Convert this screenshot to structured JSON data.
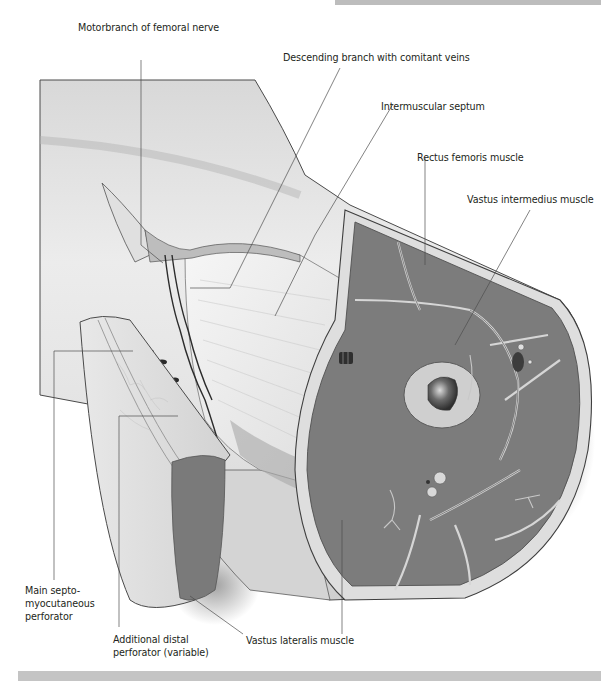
{
  "figure": {
    "style": "greyscale medical illustration",
    "colors": {
      "background": "#ffffff",
      "frame_bar": "#c4c4c4",
      "skin_light": "#e6e6e6",
      "skin_shade": "#bfbfbf",
      "muscle": "#7a7a7a",
      "fascia": "#d9d9d9",
      "bone_cortex": "#cfcfcf",
      "marrow": "#3a3a3a",
      "leader_line": "#4d4d4d",
      "text": "#231f20"
    }
  },
  "labels": {
    "motor_branch": "Motorbranch of femoral nerve",
    "descending_branch": "Descending branch with comitant veins",
    "intermuscular_septum": "Intermuscular septum",
    "rectus_femoris": "Rectus femoris muscle",
    "vastus_intermedius": "Vastus intermedius muscle",
    "main_perforator_line1": "Main septo-",
    "main_perforator_line2": "myocutaneous",
    "main_perforator_line3": "perforator",
    "distal_perforator_line1": "Additional distal",
    "distal_perforator_line2": "perforator (variable)",
    "vastus_lateralis": "Vastus lateralis muscle"
  }
}
